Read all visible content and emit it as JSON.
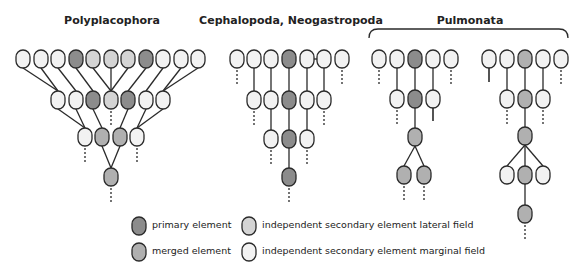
{
  "titles": {
    "polyplacophora": "Polyplacophora",
    "cephalopoda": "Cephalopoda, Neogastropoda",
    "pulmonata": "Pulmonata"
  },
  "colors": {
    "primary": "#8c8c8c",
    "merged": "#b0b0b0",
    "lateral": "#d4d4d4",
    "marginal": "#f2f2f2",
    "stroke": "#2a2a2a"
  },
  "legend": {
    "items": [
      {
        "key": "primary",
        "label": "primary element"
      },
      {
        "key": "merged",
        "label": "merged element"
      },
      {
        "key": "lateral",
        "label": "independent secondary element lateral field"
      },
      {
        "key": "marginal",
        "label": "independent secondary element marginal field"
      }
    ]
  },
  "trees": [
    {
      "name": "polyplacophora",
      "nodes": [
        {
          "id": "a1",
          "x": 23,
          "y": 59,
          "t": "marginal"
        },
        {
          "id": "a2",
          "x": 41,
          "y": 59,
          "t": "marginal"
        },
        {
          "id": "a3",
          "x": 58,
          "y": 59,
          "t": "marginal"
        },
        {
          "id": "a4",
          "x": 76,
          "y": 59,
          "t": "primary"
        },
        {
          "id": "a5",
          "x": 93,
          "y": 59,
          "t": "lateral"
        },
        {
          "id": "a6",
          "x": 111,
          "y": 59,
          "t": "lateral"
        },
        {
          "id": "a7",
          "x": 128,
          "y": 59,
          "t": "lateral"
        },
        {
          "id": "a8",
          "x": 146,
          "y": 59,
          "t": "primary"
        },
        {
          "id": "a9",
          "x": 163,
          "y": 59,
          "t": "marginal"
        },
        {
          "id": "a10",
          "x": 181,
          "y": 59,
          "t": "marginal"
        },
        {
          "id": "a11",
          "x": 198,
          "y": 59,
          "t": "marginal"
        },
        {
          "id": "b1",
          "x": 58,
          "y": 100,
          "t": "marginal"
        },
        {
          "id": "b2",
          "x": 76,
          "y": 100,
          "t": "marginal"
        },
        {
          "id": "b3",
          "x": 93,
          "y": 100,
          "t": "primary"
        },
        {
          "id": "b4",
          "x": 111,
          "y": 100,
          "t": "lateral"
        },
        {
          "id": "b5",
          "x": 128,
          "y": 100,
          "t": "primary"
        },
        {
          "id": "b6",
          "x": 146,
          "y": 100,
          "t": "marginal"
        },
        {
          "id": "b7",
          "x": 163,
          "y": 100,
          "t": "marginal"
        },
        {
          "id": "c1",
          "x": 85,
          "y": 137,
          "t": "marginal"
        },
        {
          "id": "c2",
          "x": 102,
          "y": 137,
          "t": "merged"
        },
        {
          "id": "c3",
          "x": 120,
          "y": 137,
          "t": "merged"
        },
        {
          "id": "c4",
          "x": 137,
          "y": 137,
          "t": "marginal"
        },
        {
          "id": "d1",
          "x": 111,
          "y": 177,
          "t": "merged"
        }
      ],
      "edges": [
        [
          "a1",
          "b1"
        ],
        [
          "a2",
          "b1"
        ],
        [
          "a3",
          "b2"
        ],
        [
          "a4",
          "b3"
        ],
        [
          "a5",
          "b4"
        ],
        [
          "a6",
          "b4"
        ],
        [
          "a7",
          "b4"
        ],
        [
          "a8",
          "b5"
        ],
        [
          "a9",
          "b6"
        ],
        [
          "a10",
          "b7"
        ],
        [
          "a11",
          "b7"
        ],
        [
          "b1",
          "c1"
        ],
        [
          "b2",
          "c1"
        ],
        [
          "b3",
          "c2"
        ],
        [
          "b5",
          "c3"
        ],
        [
          "b6",
          "c4"
        ],
        [
          "b7",
          "c4"
        ],
        [
          "c2",
          "d1"
        ],
        [
          "c3",
          "d1"
        ]
      ],
      "dashed": [
        "b4",
        "c1",
        "c4",
        "d1"
      ]
    },
    {
      "name": "cephalopoda",
      "nodes": [
        {
          "id": "e1",
          "x": 237,
          "y": 59,
          "t": "marginal"
        },
        {
          "id": "e2",
          "x": 254,
          "y": 59,
          "t": "marginal"
        },
        {
          "id": "e3",
          "x": 271,
          "y": 59,
          "t": "marginal"
        },
        {
          "id": "e4",
          "x": 289,
          "y": 59,
          "t": "primary"
        },
        {
          "id": "e5",
          "x": 307,
          "y": 59,
          "t": "marginal"
        },
        {
          "id": "e6",
          "x": 324,
          "y": 59,
          "t": "marginal"
        },
        {
          "id": "e7",
          "x": 342,
          "y": 59,
          "t": "marginal"
        },
        {
          "id": "f1",
          "x": 254,
          "y": 100,
          "t": "marginal"
        },
        {
          "id": "f2",
          "x": 271,
          "y": 100,
          "t": "marginal"
        },
        {
          "id": "f3",
          "x": 289,
          "y": 100,
          "t": "primary"
        },
        {
          "id": "f4",
          "x": 307,
          "y": 100,
          "t": "marginal"
        },
        {
          "id": "f5",
          "x": 324,
          "y": 100,
          "t": "marginal"
        },
        {
          "id": "g1",
          "x": 271,
          "y": 139,
          "t": "marginal"
        },
        {
          "id": "g2",
          "x": 289,
          "y": 139,
          "t": "primary"
        },
        {
          "id": "g3",
          "x": 307,
          "y": 139,
          "t": "marginal"
        },
        {
          "id": "h1",
          "x": 289,
          "y": 177,
          "t": "primary"
        }
      ],
      "edges": [
        [
          "e2",
          "f1"
        ],
        [
          "e3",
          "f2"
        ],
        [
          "e4",
          "f3"
        ],
        [
          "e5",
          "f4"
        ],
        [
          "e6",
          "f5"
        ],
        [
          "e5",
          "e6"
        ],
        [
          "f2",
          "g1"
        ],
        [
          "f3",
          "g2"
        ],
        [
          "f4",
          "g3"
        ],
        [
          "g2",
          "h1"
        ]
      ],
      "dashed": [
        "e1",
        "e7",
        "f1",
        "f5",
        "g1",
        "g3",
        "h1"
      ]
    },
    {
      "name": "pulmonata-left",
      "nodes": [
        {
          "id": "i1",
          "x": 379,
          "y": 59,
          "t": "marginal"
        },
        {
          "id": "i2",
          "x": 397,
          "y": 59,
          "t": "marginal"
        },
        {
          "id": "i3",
          "x": 415,
          "y": 59,
          "t": "primary"
        },
        {
          "id": "i4",
          "x": 433,
          "y": 59,
          "t": "marginal"
        },
        {
          "id": "i5",
          "x": 451,
          "y": 59,
          "t": "marginal"
        },
        {
          "id": "j1",
          "x": 397,
          "y": 99,
          "t": "marginal"
        },
        {
          "id": "j2",
          "x": 415,
          "y": 99,
          "t": "primary"
        },
        {
          "id": "j3",
          "x": 433,
          "y": 99,
          "t": "marginal"
        },
        {
          "id": "k1",
          "x": 415,
          "y": 137,
          "t": "merged"
        },
        {
          "id": "l1",
          "x": 404,
          "y": 175,
          "t": "merged"
        },
        {
          "id": "l2",
          "x": 424,
          "y": 175,
          "t": "merged"
        }
      ],
      "edges": [
        [
          "i2",
          "j1"
        ],
        [
          "i3",
          "j2"
        ],
        [
          "i4",
          "j3"
        ],
        [
          "j2",
          "k1"
        ],
        [
          "k1",
          "l1"
        ],
        [
          "k1",
          "l2"
        ]
      ],
      "stubs": [
        [
          "j3",
          121
        ]
      ],
      "dashed": [
        "i1",
        "i5",
        "j1",
        "l1",
        "l2"
      ]
    },
    {
      "name": "pulmonata-right",
      "nodes": [
        {
          "id": "m1",
          "x": 489,
          "y": 59,
          "t": "marginal"
        },
        {
          "id": "m2",
          "x": 507,
          "y": 59,
          "t": "marginal"
        },
        {
          "id": "m3",
          "x": 525,
          "y": 59,
          "t": "merged"
        },
        {
          "id": "m4",
          "x": 543,
          "y": 59,
          "t": "marginal"
        },
        {
          "id": "m5",
          "x": 561,
          "y": 59,
          "t": "marginal"
        },
        {
          "id": "n1",
          "x": 507,
          "y": 99,
          "t": "marginal"
        },
        {
          "id": "n2",
          "x": 525,
          "y": 99,
          "t": "merged"
        },
        {
          "id": "n3",
          "x": 543,
          "y": 99,
          "t": "marginal"
        },
        {
          "id": "o1",
          "x": 525,
          "y": 136,
          "t": "merged"
        },
        {
          "id": "p1",
          "x": 507,
          "y": 175,
          "t": "marginal"
        },
        {
          "id": "p2",
          "x": 525,
          "y": 175,
          "t": "merged"
        },
        {
          "id": "p3",
          "x": 543,
          "y": 175,
          "t": "marginal"
        },
        {
          "id": "q1",
          "x": 525,
          "y": 214,
          "t": "merged"
        }
      ],
      "edges": [
        [
          "m2",
          "n1"
        ],
        [
          "m3",
          "n2"
        ],
        [
          "m4",
          "n3"
        ],
        [
          "n2",
          "o1"
        ],
        [
          "o1",
          "p1"
        ],
        [
          "o1",
          "p2"
        ],
        [
          "o1",
          "p3"
        ],
        [
          "p2",
          "q1"
        ]
      ],
      "stubs": [
        [
          "m1",
          82
        ]
      ],
      "dashed": [
        "m5",
        "n1",
        "n3",
        "q1"
      ]
    }
  ]
}
